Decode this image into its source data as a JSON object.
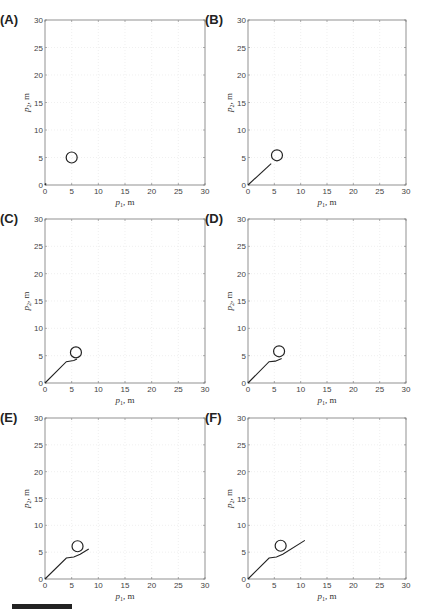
{
  "chart_data": [
    {
      "panel": "(A)",
      "type": "line",
      "xlabel": "p1, m",
      "ylabel": "p2, m",
      "xlim": [
        0,
        30
      ],
      "ylim": [
        0,
        30
      ],
      "xticks": [
        0,
        5,
        10,
        15,
        20,
        25,
        30
      ],
      "yticks": [
        0,
        5,
        10,
        15,
        20,
        25,
        30
      ],
      "grid": true,
      "obstacle": {
        "x": 5,
        "y": 5,
        "r": 0.7
      },
      "trajectory": [
        [
          0,
          0
        ],
        [
          0.2,
          0.3
        ]
      ]
    },
    {
      "panel": "(B)",
      "type": "line",
      "xlabel": "p1, m",
      "ylabel": "p2, m",
      "xlim": [
        0,
        30
      ],
      "ylim": [
        0,
        30
      ],
      "xticks": [
        0,
        5,
        10,
        15,
        20,
        25,
        30
      ],
      "yticks": [
        0,
        5,
        10,
        15,
        20,
        25,
        30
      ],
      "grid": true,
      "obstacle": {
        "x": 5.5,
        "y": 5.4,
        "r": 0.7
      },
      "trajectory": [
        [
          0,
          0
        ],
        [
          4.4,
          3.9
        ]
      ]
    },
    {
      "panel": "(C)",
      "type": "line",
      "xlabel": "p1, m",
      "ylabel": "p2, m",
      "xlim": [
        0,
        30
      ],
      "ylim": [
        0,
        30
      ],
      "xticks": [
        0,
        5,
        10,
        15,
        20,
        25,
        30
      ],
      "yticks": [
        0,
        5,
        10,
        15,
        20,
        25,
        30
      ],
      "grid": true,
      "obstacle": {
        "x": 5.8,
        "y": 5.6,
        "r": 0.7
      },
      "trajectory": [
        [
          0,
          0
        ],
        [
          4.0,
          3.9
        ],
        [
          5.4,
          4.1
        ],
        [
          6.0,
          4.4
        ]
      ]
    },
    {
      "panel": "(D)",
      "type": "line",
      "xlabel": "p1, m",
      "ylabel": "p2, m",
      "xlim": [
        0,
        30
      ],
      "ylim": [
        0,
        30
      ],
      "xticks": [
        0,
        5,
        10,
        15,
        20,
        25,
        30
      ],
      "yticks": [
        0,
        5,
        10,
        15,
        20,
        25,
        30
      ],
      "grid": true,
      "obstacle": {
        "x": 5.9,
        "y": 5.8,
        "r": 0.7
      },
      "trajectory": [
        [
          0,
          0
        ],
        [
          4.0,
          3.9
        ],
        [
          5.2,
          4.0
        ],
        [
          6.4,
          4.5
        ]
      ]
    },
    {
      "panel": "(E)",
      "type": "line",
      "xlabel": "p1, m",
      "ylabel": "p2, m",
      "xlim": [
        0,
        30
      ],
      "ylim": [
        0,
        30
      ],
      "xticks": [
        0,
        5,
        10,
        15,
        20,
        25,
        30
      ],
      "yticks": [
        0,
        5,
        10,
        15,
        20,
        25,
        30
      ],
      "grid": true,
      "obstacle": {
        "x": 6.1,
        "y": 6.1,
        "r": 0.7
      },
      "trajectory": [
        [
          0,
          0
        ],
        [
          4.0,
          3.9
        ],
        [
          5.4,
          4.1
        ],
        [
          6.6,
          4.6
        ],
        [
          8.2,
          5.6
        ]
      ]
    },
    {
      "panel": "(F)",
      "type": "line",
      "xlabel": "p1, m",
      "ylabel": "p2, m",
      "xlim": [
        0,
        30
      ],
      "ylim": [
        0,
        30
      ],
      "xticks": [
        0,
        5,
        10,
        15,
        20,
        25,
        30
      ],
      "yticks": [
        0,
        5,
        10,
        15,
        20,
        25,
        30
      ],
      "grid": true,
      "obstacle": {
        "x": 6.2,
        "y": 6.2,
        "r": 0.7
      },
      "trajectory": [
        [
          0,
          0
        ],
        [
          4.0,
          3.9
        ],
        [
          5.4,
          4.1
        ],
        [
          6.6,
          4.6
        ],
        [
          10.8,
          7.2
        ]
      ]
    }
  ]
}
